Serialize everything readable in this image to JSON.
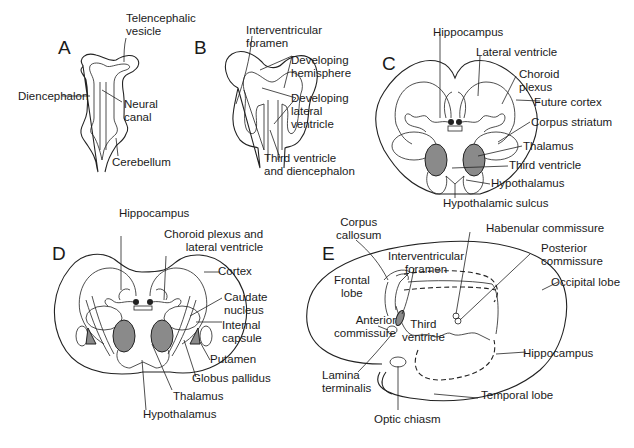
{
  "figure": {
    "colors": {
      "line": "#222222",
      "structure_fill": "#8a8a8a",
      "background": "#ffffff"
    }
  },
  "panels": {
    "A": {
      "letter": "A",
      "labels": {
        "telencephalic_vesicle": "Telencephalic\nvesicle",
        "diencephalon": "Diencephalon",
        "neural_canal": "Neural\ncanal",
        "cerebellum": "Cerebellum"
      }
    },
    "B": {
      "letter": "B",
      "labels": {
        "interventricular_foramen": "Interventricular\nforamen",
        "developing_hemisphere": "Developing\nhemisphere",
        "developing_lateral_ventricle": "Developing\nlateral\nventricle",
        "third_ventricle_diencephalon": "Third ventricle\nand diencephalon"
      }
    },
    "C": {
      "letter": "C",
      "labels": {
        "hippocampus": "Hippocampus",
        "lateral_ventricle": "Lateral ventricle",
        "choroid_plexus": "Choroid\nplexus",
        "future_cortex": "Future cortex",
        "corpus_striatum": "Corpus striatum",
        "thalamus": "Thalamus",
        "third_ventricle": "Third ventricle",
        "hypothalamus": "Hypothalamus",
        "hypothalamic_sulcus": "Hypothalamic sulcus"
      }
    },
    "D": {
      "letter": "D",
      "labels": {
        "hippocampus": "Hippocampus",
        "choroid_plexus_lateral_ventricle": "Choroid plexus and\nlateral ventricle",
        "cortex": "Cortex",
        "caudate_nucleus": "Caudate\nnucleus",
        "internal_capsule": "Internal\ncapsule",
        "putamen": "Putamen",
        "globus_pallidus": "Globus pallidus",
        "thalamus": "Thalamus",
        "hypothalamus": "Hypothalamus"
      }
    },
    "E": {
      "letter": "E",
      "labels": {
        "corpus_callosum": "Corpus\ncallosum",
        "habenular_commissure": "Habenular commissure",
        "interventricular_foramen": "Interventricular\nforamen",
        "posterior_commissure": "Posterior\ncommissure",
        "frontal_lobe": "Frontal\nlobe",
        "occipital_lobe": "Occipital lobe",
        "anterior_commissure": "Anterior\ncommissure",
        "third_ventricle": "Third\nventricle",
        "hippocampus": "Hippocampus",
        "lamina_terminalis": "Lamina\nterminalis",
        "temporal_lobe": "Temporal lobe",
        "optic_chiasm": "Optic chiasm"
      }
    }
  }
}
